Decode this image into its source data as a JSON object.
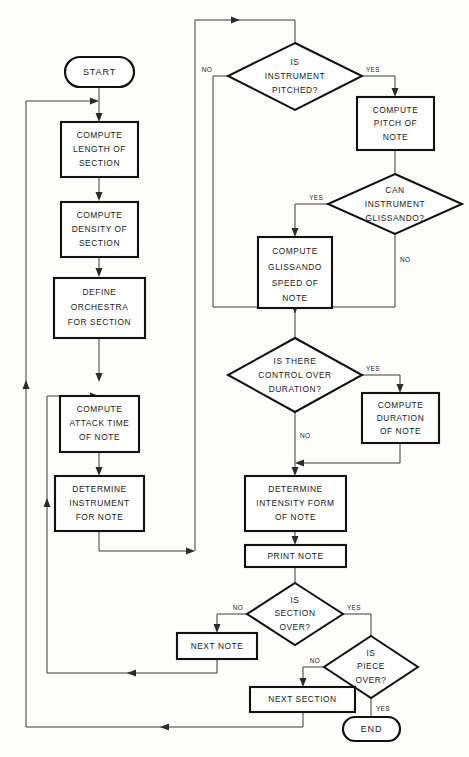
{
  "diagram": {
    "canvas": {
      "width": 469,
      "height": 757
    },
    "colors": {
      "background": "#fdfdfc",
      "node_stroke": "#111111",
      "node_fill": "#ffffff",
      "connector": "#3a3a3a",
      "text": "#1a1a1a"
    }
  },
  "nodes": {
    "start": {
      "type": "terminator",
      "lines": [
        "START"
      ]
    },
    "compute_length": {
      "type": "process",
      "lines": [
        "COMPUTE",
        "LENGTH OF",
        "SECTION"
      ]
    },
    "compute_density": {
      "type": "process",
      "lines": [
        "COMPUTE",
        "DENSITY OF",
        "SECTION"
      ]
    },
    "define_orchestra": {
      "type": "process",
      "lines": [
        "DEFINE",
        "ORCHESTRA",
        "FOR SECTION"
      ]
    },
    "compute_attack": {
      "type": "process",
      "lines": [
        "COMPUTE",
        "ATTACK TIME",
        "OF NOTE"
      ]
    },
    "determine_instrument": {
      "type": "process",
      "lines": [
        "DETERMINE",
        "INSTRUMENT",
        "FOR NOTE"
      ]
    },
    "is_pitched": {
      "type": "decision",
      "lines": [
        "IS",
        "INSTRUMENT",
        "PITCHED?"
      ]
    },
    "compute_pitch": {
      "type": "process",
      "lines": [
        "COMPUTE",
        "PITCH OF",
        "NOTE"
      ]
    },
    "can_glissando": {
      "type": "decision",
      "lines": [
        "CAN",
        "INSTRUMENT",
        "GLISSANDO?"
      ]
    },
    "compute_glissando": {
      "type": "process",
      "lines": [
        "COMPUTE",
        "GLISSANDO",
        "SPEED OF",
        "NOTE"
      ]
    },
    "control_duration": {
      "type": "decision",
      "lines": [
        "IS THERE",
        "CONTROL OVER",
        "DURATION?"
      ]
    },
    "compute_duration": {
      "type": "process",
      "lines": [
        "COMPUTE",
        "DURATION",
        "OF NOTE"
      ]
    },
    "determine_intensity": {
      "type": "process",
      "lines": [
        "DETERMINE",
        "INTENSITY FORM",
        "OF NOTE"
      ]
    },
    "print_note": {
      "type": "process",
      "lines": [
        "PRINT NOTE"
      ]
    },
    "is_section_over": {
      "type": "decision",
      "lines": [
        "IS",
        "SECTION",
        "OVER?"
      ]
    },
    "next_note": {
      "type": "process",
      "lines": [
        "NEXT NOTE"
      ]
    },
    "is_piece_over": {
      "type": "decision",
      "lines": [
        "IS",
        "PIECE",
        "OVER?"
      ]
    },
    "next_section": {
      "type": "process",
      "lines": [
        "NEXT SECTION"
      ]
    },
    "end": {
      "type": "terminator",
      "lines": [
        "END"
      ]
    }
  },
  "edge_labels": {
    "pitched_no": "NO",
    "pitched_yes": "YES",
    "glissando_yes": "YES",
    "glissando_no": "NO",
    "duration_yes": "YES",
    "duration_no": "NO",
    "section_no": "NO",
    "section_yes": "YES",
    "piece_no": "NO",
    "piece_yes": "YES"
  }
}
